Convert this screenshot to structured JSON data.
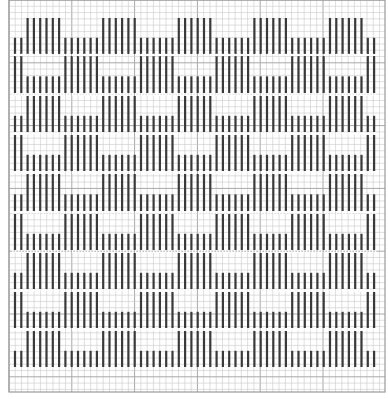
{
  "pattern": {
    "type": "block-weave-draft",
    "colors": {
      "background": "#ffffff",
      "grid_minor": "#c9c9c9",
      "grid_major": "#a8a8a8",
      "bar": "#3a3a3a"
    },
    "grid": {
      "origin_x": 9,
      "origin_y": 0,
      "cell": 6.28,
      "cols": 60,
      "rows": 62,
      "major_every": 10,
      "right": 385,
      "bottom": 392
    },
    "columns": {
      "first_x": 15,
      "step": 6.3,
      "count": 58,
      "groups": [
        {
          "type": "B",
          "count": 2
        },
        {
          "type": "A",
          "count": 6
        },
        {
          "type": "B",
          "count": 6
        },
        {
          "type": "A",
          "count": 6
        },
        {
          "type": "B",
          "count": 6
        },
        {
          "type": "A",
          "count": 6
        },
        {
          "type": "B",
          "count": 6
        },
        {
          "type": "A",
          "count": 6
        },
        {
          "type": "B",
          "count": 6
        },
        {
          "type": "A",
          "count": 6
        },
        {
          "type": "B",
          "count": 2
        }
      ]
    },
    "bands": [
      {
        "top": 18,
        "bottom": 54,
        "full": "A"
      },
      {
        "top": 56,
        "bottom": 93,
        "full": "B"
      },
      {
        "top": 96,
        "bottom": 132,
        "full": "A"
      },
      {
        "top": 135,
        "bottom": 171,
        "full": "B"
      },
      {
        "top": 174,
        "bottom": 211,
        "full": "A"
      },
      {
        "top": 214,
        "bottom": 250,
        "full": "B"
      },
      {
        "top": 253,
        "bottom": 289,
        "full": "A"
      },
      {
        "top": 292,
        "bottom": 328,
        "full": "B"
      },
      {
        "top": 331,
        "bottom": 367,
        "full": "A"
      }
    ],
    "short_fraction": 0.45
  }
}
